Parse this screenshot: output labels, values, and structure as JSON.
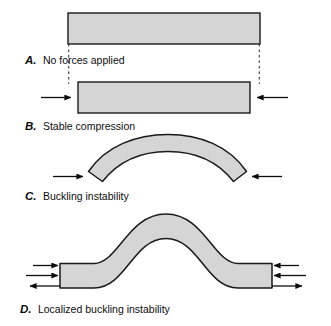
{
  "figure": {
    "background_color": "#ffffff",
    "beam_fill_color": "#d5d5d5",
    "beam_stroke_color": "#1a1a1a",
    "arrow_color": "#0d0d0d",
    "dashed_guide_color": "#3a3a3a",
    "caption_color": "#0d0d0d"
  },
  "panels": [
    {
      "id": "A",
      "letter": "A.",
      "label": "No forces applied",
      "shape": "straight-bar",
      "arrows": 0,
      "has_dashed_guides": true
    },
    {
      "id": "B",
      "letter": "B.",
      "label": "Stable compression",
      "shape": "straight-bar-compressed",
      "arrows": 2,
      "has_dashed_guides": false
    },
    {
      "id": "C",
      "letter": "C.",
      "label": "Buckling instability",
      "shape": "arch-curve",
      "arrows": 2,
      "has_dashed_guides": false
    },
    {
      "id": "D",
      "letter": "D.",
      "label": "Localized buckling instability",
      "shape": "localized-hump",
      "arrows": 6,
      "has_dashed_guides": false
    }
  ]
}
